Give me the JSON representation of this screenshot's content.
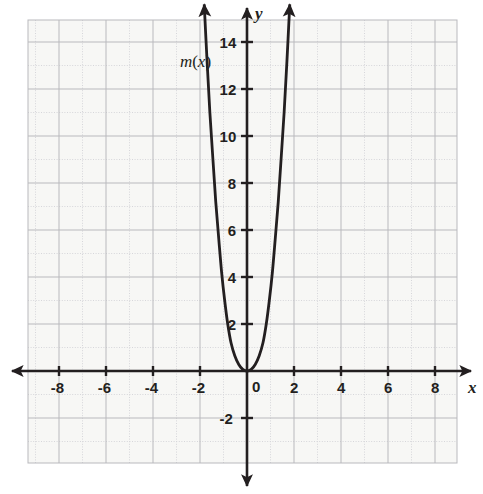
{
  "figure": {
    "background_color": "#ffffff",
    "grid_color": "#b9b9bd",
    "grid_minor_color": "#d6d6da",
    "axis_color": "#231f20",
    "curve_color": "#231f20",
    "paper_tint": "#f7f7f5"
  },
  "axis_labels": {
    "x": "x",
    "y": "y"
  },
  "function_label": {
    "prefix": "m",
    "open": "(",
    "variable": "x",
    "close": ")",
    "text": "m(x)"
  },
  "chart_data": {
    "type": "line",
    "title": "",
    "xlabel": "x",
    "ylabel": "y",
    "grid": true,
    "legend": "none",
    "annotations": [
      {
        "text": "m(x)",
        "x": -2.6,
        "y": 13.2
      }
    ],
    "xlim": [
      -9.3,
      8.9
    ],
    "ylim": [
      -4.0,
      15.8
    ],
    "x_ticks": [
      -8,
      -6,
      -4,
      -2,
      0,
      2,
      4,
      6,
      8
    ],
    "x_tick_labels": [
      "-8",
      "-6",
      "-4",
      "-2",
      "0",
      "2",
      "4",
      "6",
      "8"
    ],
    "y_ticks": [
      -2,
      2,
      4,
      6,
      8,
      10,
      12,
      14
    ],
    "y_tick_labels": [
      "-2",
      "2",
      "4",
      "6",
      "8",
      "10",
      "12",
      "14"
    ],
    "x_tick_step": 2,
    "y_tick_step": 2,
    "grid_step": 1,
    "origin_label": "0",
    "series": [
      {
        "name": "m(x)",
        "kind": "curve",
        "arrow_start": true,
        "arrow_end": true,
        "description": "steep even-power parabola-like curve with vertex at the origin",
        "points": [
          {
            "x": -1.82,
            "y": 15.6
          },
          {
            "x": -1.7,
            "y": 13.2
          },
          {
            "x": -1.58,
            "y": 11.0
          },
          {
            "x": -1.45,
            "y": 9.0
          },
          {
            "x": -1.33,
            "y": 7.2
          },
          {
            "x": -1.2,
            "y": 5.6
          },
          {
            "x": -1.08,
            "y": 4.2
          },
          {
            "x": -0.95,
            "y": 3.0
          },
          {
            "x": -0.82,
            "y": 2.0
          },
          {
            "x": -0.68,
            "y": 1.2
          },
          {
            "x": -0.52,
            "y": 0.65
          },
          {
            "x": -0.35,
            "y": 0.28
          },
          {
            "x": -0.18,
            "y": 0.07
          },
          {
            "x": 0.0,
            "y": 0.0
          },
          {
            "x": 0.18,
            "y": 0.07
          },
          {
            "x": 0.35,
            "y": 0.28
          },
          {
            "x": 0.52,
            "y": 0.65
          },
          {
            "x": 0.68,
            "y": 1.2
          },
          {
            "x": 0.82,
            "y": 2.0
          },
          {
            "x": 0.95,
            "y": 3.0
          },
          {
            "x": 1.08,
            "y": 4.2
          },
          {
            "x": 1.2,
            "y": 5.6
          },
          {
            "x": 1.33,
            "y": 7.2
          },
          {
            "x": 1.45,
            "y": 9.0
          },
          {
            "x": 1.58,
            "y": 11.0
          },
          {
            "x": 1.7,
            "y": 13.2
          },
          {
            "x": 1.82,
            "y": 15.6
          }
        ]
      }
    ]
  }
}
